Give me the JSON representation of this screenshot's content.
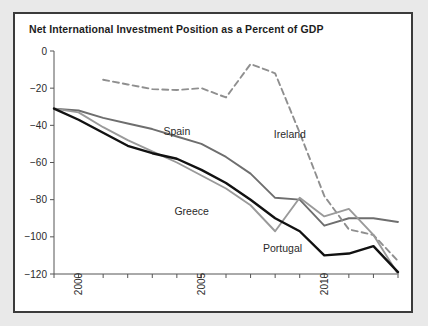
{
  "figure": {
    "background_color": "#ffffff",
    "page_background_color": "#e9e9e9",
    "border_color": "#3b3b3b"
  },
  "chart_data": {
    "type": "line",
    "title": "Net International Investment Position as a Percent of GDP",
    "xlabel": "",
    "ylabel": "",
    "xlim": [
      1999,
      2013
    ],
    "ylim": [
      -120,
      0
    ],
    "grid": false,
    "legend_position": "inline-annotations",
    "y_ticks": [
      0,
      -20,
      -40,
      -60,
      -80,
      -100,
      -120
    ],
    "y_tick_labels": [
      "0",
      "−20",
      "−40",
      "−60",
      "−80",
      "−100",
      "−120"
    ],
    "x_ticks": [
      1999,
      2000,
      2001,
      2002,
      2003,
      2004,
      2005,
      2006,
      2007,
      2008,
      2009,
      2010,
      2011,
      2012,
      2013
    ],
    "x_tick_labels_shown": [
      "2000",
      "2005",
      "2010"
    ],
    "x_tick_label_years": [
      2000,
      2005,
      2010
    ],
    "series": [
      {
        "name": "Spain",
        "color": "#6e6e6e",
        "style": "solid",
        "width": 1.9,
        "label_x": 2004.0,
        "label_y": -45,
        "x": [
          1999,
          2000,
          2001,
          2002,
          2003,
          2004,
          2005,
          2006,
          2007,
          2008,
          2009,
          2010,
          2011,
          2012,
          2013
        ],
        "values": [
          -31,
          -32,
          -36,
          -39,
          -42,
          -46,
          -50,
          -57,
          -66,
          -79,
          -80,
          -94,
          -90,
          -90,
          -92
        ]
      },
      {
        "name": "Ireland",
        "color": "#8f8f8f",
        "style": "dashed",
        "width": 1.9,
        "label_x": 2008.6,
        "label_y": -47,
        "x": [
          2001,
          2002,
          2003,
          2004,
          2005,
          2006,
          2007,
          2008,
          2009,
          2010,
          2011,
          2012,
          2013
        ],
        "values": [
          -15.5,
          -18,
          -20.5,
          -21,
          -20,
          -25,
          -7,
          -12,
          -44,
          -78,
          -96,
          -99,
          -113
        ]
      },
      {
        "name": "Greece",
        "color": "#9a9a9a",
        "style": "solid",
        "width": 1.9,
        "label_x": 2004.6,
        "label_y": -88,
        "x": [
          1999,
          2000,
          2001,
          2002,
          2003,
          2004,
          2005,
          2006,
          2007,
          2008,
          2009,
          2010,
          2011,
          2012,
          2013
        ],
        "values": [
          -31,
          -33,
          -41,
          -48,
          -54,
          -60,
          -67,
          -74,
          -83,
          -97,
          -79,
          -89,
          -85,
          -99,
          -120
        ]
      },
      {
        "name": "Portugal",
        "color": "#111111",
        "style": "solid",
        "width": 2.4,
        "label_x": 2008.3,
        "label_y": -108,
        "x": [
          1999,
          2000,
          2001,
          2002,
          2003,
          2004,
          2005,
          2006,
          2007,
          2008,
          2009,
          2010,
          2011,
          2012,
          2013
        ],
        "values": [
          -31,
          -37,
          -44,
          -51,
          -55,
          -58,
          -64,
          -71,
          -80,
          -90,
          -97,
          -110,
          -109,
          -105,
          -119
        ]
      }
    ]
  }
}
